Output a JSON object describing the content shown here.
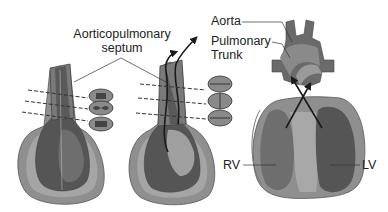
{
  "diagram": {
    "stages": [
      {
        "id": "stage-1",
        "description": "Truncus arteriosus with ridges; cross-sections show early septum"
      },
      {
        "id": "stage-2",
        "description": "Spiraling septum divides truncus; arrows show divergent outflow"
      },
      {
        "id": "stage-3",
        "description": "Completed heart with aorta and pulmonary trunk crossing over ventricles"
      }
    ],
    "labels": {
      "septum_line1": "Aorticopulmonary",
      "septum_line2": "septum",
      "aorta": "Aorta",
      "pulmonary_line1": "Pulmonary",
      "pulmonary_line2": "Trunk",
      "rv": "RV",
      "lv": "LV"
    },
    "colors": {
      "background": "#ffffff",
      "outer_wall": "#8f8f8f",
      "wall_light": "#b3b3b3",
      "chamber_dark": "#555555",
      "chamber_mid": "#6e6e6e",
      "septum_light": "#a8a8a8",
      "line": "#333333",
      "arrow": "#1a1a1a"
    }
  }
}
